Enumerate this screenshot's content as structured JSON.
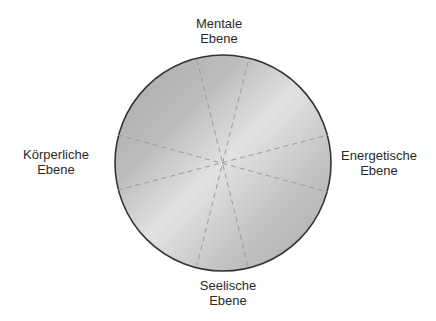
{
  "diagram": {
    "type": "circle-with-radial-dividers",
    "circle": {
      "cx": 223,
      "cy": 163,
      "r": 108,
      "stroke": "#333333",
      "gradient": {
        "dark": "#a9a9a9",
        "mid": "#c4c4c4",
        "light": "#e2e2e2"
      }
    },
    "dividers": {
      "style": "dashed",
      "color": "#9a9a9a",
      "lines": [
        {
          "x1": 197,
          "y1": 60,
          "x2": 248,
          "y2": 266
        },
        {
          "x1": 248,
          "y1": 62,
          "x2": 197,
          "y2": 265
        },
        {
          "x1": 118,
          "y1": 135,
          "x2": 328,
          "y2": 192
        },
        {
          "x1": 118,
          "y1": 190,
          "x2": 328,
          "y2": 135
        }
      ]
    },
    "labels": {
      "top": {
        "line1": "Mentale",
        "line2": "Ebene"
      },
      "left": {
        "line1": "Körperliche",
        "line2": "Ebene"
      },
      "right": {
        "line1": "Energetische",
        "line2": "Ebene"
      },
      "bottom": {
        "line1": "Seelische",
        "line2": "Ebene"
      }
    }
  }
}
